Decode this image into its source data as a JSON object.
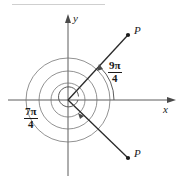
{
  "figure": {
    "type": "polar-angle-diagram",
    "axes": {
      "x_label": "x",
      "y_label": "y",
      "origin": [
        68,
        100
      ]
    },
    "points": [
      {
        "name": "point-upper",
        "label": "P",
        "at": [
          128,
          35
        ]
      },
      {
        "name": "point-lower",
        "label": "P",
        "at": [
          128,
          158
        ]
      }
    ],
    "angles": [
      {
        "name": "angle-nine-pi-over-four",
        "numerator": "9π",
        "denominator": "4",
        "value_radians": 7.0686,
        "degrees": 405,
        "direction": "counterclockwise",
        "terminal_point": "P"
      },
      {
        "name": "angle-seven-pi-over-four",
        "numerator": "7π",
        "denominator": "4",
        "value_radians": 5.4978,
        "degrees": 315,
        "direction": "counterclockwise",
        "terminal_point": "P"
      }
    ],
    "colors": {
      "ink": "#1a1a1a",
      "arc": "#555555",
      "rule": "#cfcfcf",
      "background": "#ffffff"
    }
  }
}
